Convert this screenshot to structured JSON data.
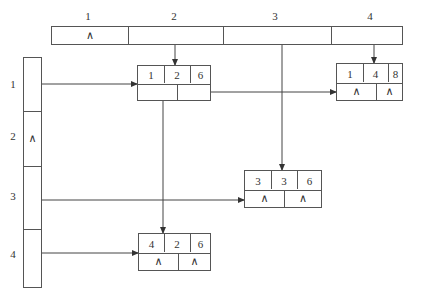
{
  "diagram": {
    "type": "orthogonal-list-sparse-matrix",
    "null_symbol": "∧",
    "column_headers": {
      "labels": [
        "1",
        "2",
        "3",
        "4"
      ],
      "cells": [
        "∧",
        "",
        "",
        ""
      ]
    },
    "row_headers": {
      "labels": [
        "1",
        "2",
        "3",
        "4"
      ],
      "cells": [
        "",
        "∧",
        "",
        ""
      ]
    },
    "nodes": [
      {
        "id": "n126",
        "row": "1",
        "col": "2",
        "val": "6",
        "right": "",
        "down": ""
      },
      {
        "id": "n148",
        "row": "1",
        "col": "4",
        "val": "8",
        "right": "∧",
        "down": "∧"
      },
      {
        "id": "n336",
        "row": "3",
        "col": "3",
        "val": "6",
        "right": "∧",
        "down": "∧"
      },
      {
        "id": "n426",
        "row": "4",
        "col": "2",
        "val": "6",
        "right": "∧",
        "down": "∧"
      }
    ]
  }
}
